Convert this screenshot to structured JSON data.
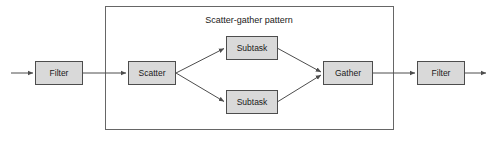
{
  "diagram": {
    "title": "Scatter-gather pattern",
    "colors": {
      "node_fill": "#d9d9d9",
      "node_stroke": "#4d4d4d",
      "group_stroke": "#666666",
      "connector": "#4d4d4d",
      "background": "#ffffff",
      "text": "#1a1a1a"
    },
    "group_box": {
      "name": "scatter-gather-group",
      "x": 105,
      "y": 6,
      "width": 289,
      "height": 124
    },
    "nodes": [
      {
        "id": "filter-in",
        "label": "Filter",
        "x": 35,
        "y": 61,
        "width": 48,
        "height": 24
      },
      {
        "id": "scatter",
        "label": "Scatter",
        "x": 128,
        "y": 61,
        "width": 48,
        "height": 24
      },
      {
        "id": "subtask-top",
        "label": "Subtask",
        "x": 226,
        "y": 36,
        "width": 52,
        "height": 24
      },
      {
        "id": "subtask-bot",
        "label": "Subtask",
        "x": 226,
        "y": 90,
        "width": 52,
        "height": 24
      },
      {
        "id": "gather",
        "label": "Gather",
        "x": 323,
        "y": 61,
        "width": 50,
        "height": 24
      },
      {
        "id": "filter-out",
        "label": "Filter",
        "x": 417,
        "y": 61,
        "width": 48,
        "height": 24
      }
    ],
    "connectors": [
      {
        "id": "entry-to-filter-in",
        "from": "input",
        "to": "filter-in",
        "arrow": true
      },
      {
        "id": "filter-in-to-scatter",
        "from": "filter-in",
        "to": "scatter",
        "arrow": true
      },
      {
        "id": "scatter-to-subtask-top",
        "from": "scatter",
        "to": "subtask-top",
        "arrow": true
      },
      {
        "id": "scatter-to-subtask-bot",
        "from": "scatter",
        "to": "subtask-bot",
        "arrow": true
      },
      {
        "id": "subtask-top-to-gather",
        "from": "subtask-top",
        "to": "gather",
        "arrow": true
      },
      {
        "id": "subtask-bot-to-gather",
        "from": "subtask-bot",
        "to": "gather",
        "arrow": true
      },
      {
        "id": "gather-to-filter-out",
        "from": "gather",
        "to": "filter-out",
        "arrow": true
      },
      {
        "id": "filter-out-to-exit",
        "from": "filter-out",
        "to": "output",
        "arrow": true
      }
    ],
    "labels": {
      "filter_in": "Filter",
      "scatter": "Scatter",
      "subtask_top": "Subtask",
      "subtask_bottom": "Subtask",
      "gather": "Gather",
      "filter_out": "Filter"
    }
  }
}
